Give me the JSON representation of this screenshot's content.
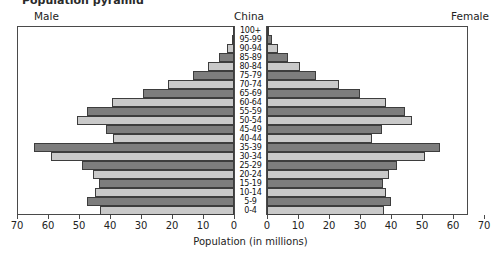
{
  "title_partial": "Population pyramid",
  "header": {
    "male_label": "Male",
    "chart_title": "China",
    "female_label": "Female"
  },
  "axis": {
    "title": "Population (in millions)",
    "tick_labels_left": [
      "70",
      "60",
      "50",
      "40",
      "30",
      "20",
      "10",
      "0"
    ],
    "tick_labels_right": [
      "0",
      "10",
      "20",
      "30",
      "40",
      "50",
      "60",
      "70"
    ],
    "max": 70,
    "step": 10,
    "units": "millions"
  },
  "colors": {
    "bar_dark": "#7d7d7d",
    "bar_light": "#c9c9c9",
    "bar_border": "#3d3d3d",
    "frame": "#4a4a4a",
    "background": "#ffffff",
    "text": "#232323"
  },
  "chart_data": {
    "type": "bar",
    "subtype": "population-pyramid",
    "title": "China",
    "xlabel": "Population (in millions)",
    "ylabel": "",
    "xlim": [
      -70,
      70
    ],
    "grid": false,
    "legend": [
      "Male",
      "Female"
    ],
    "legend_position": "top-outside",
    "categories": [
      "100+",
      "95-99",
      "90-94",
      "85-89",
      "80-84",
      "75-79",
      "70-74",
      "65-69",
      "60-64",
      "55-59",
      "50-54",
      "45-49",
      "40-44",
      "35-39",
      "30-34",
      "25-29",
      "20-24",
      "15-19",
      "10-14",
      "5-9",
      "0-4"
    ],
    "series": [
      {
        "name": "Male",
        "side": "left",
        "values": [
          0.1,
          0.8,
          2.2,
          4.8,
          8.4,
          13.2,
          21.3,
          29.5,
          39.5,
          47.4,
          50.6,
          41.3,
          39.0,
          64.5,
          59.0,
          49.0,
          45.5,
          43.5,
          45.0,
          47.5,
          43.2
        ]
      },
      {
        "name": "Female",
        "side": "right",
        "values": [
          0.2,
          1.5,
          3.5,
          6.8,
          10.6,
          15.8,
          23.2,
          30.0,
          38.5,
          44.5,
          46.8,
          37.0,
          34.0,
          55.8,
          51.0,
          42.0,
          39.5,
          37.5,
          38.5,
          40.0,
          37.6
        ]
      }
    ],
    "shading_pattern": [
      "dark",
      "light"
    ]
  }
}
